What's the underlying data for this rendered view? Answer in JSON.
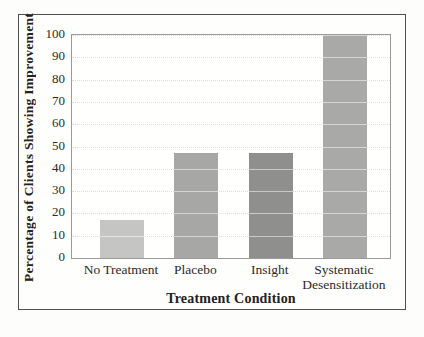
{
  "chart_data": {
    "type": "bar",
    "title": "",
    "categories": [
      "No Treatment",
      "Placebo",
      "Insight",
      "Systematic Desensitization"
    ],
    "values": [
      17,
      47,
      47,
      100
    ],
    "bar_colors": [
      "#c5c6c4",
      "#a7a8a6",
      "#8f908e",
      "#a9aaa8"
    ],
    "xlabel": "Treatment Condition",
    "ylabel": "Percentage of Clients Showing Improvement",
    "ylim": [
      0,
      100
    ],
    "yticks": [
      0,
      10,
      20,
      30,
      40,
      50,
      60,
      70,
      80,
      90,
      100
    ],
    "grid": "horizontal-dotted",
    "legend": "none",
    "colors": {
      "frame_border": "#4f4f4f",
      "plot_border": "#9a9a9a",
      "gridline": "#bdbdbd",
      "text": "#2b2b2b"
    }
  }
}
